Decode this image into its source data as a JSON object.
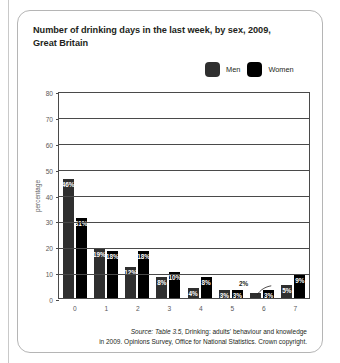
{
  "card": {
    "title": "Number of drinking days in the last week, by sex, 2009, Great Britain"
  },
  "legend": {
    "items": [
      {
        "label": "Men",
        "color": "#2f2f2f",
        "icon": "legend-swatch-icon"
      },
      {
        "label": "Women",
        "color": "#000000",
        "icon": "legend-swatch-icon"
      }
    ]
  },
  "source": {
    "italic_lead": "Source: Table 3.5,",
    "line1_rest": " Drinking: adults' behaviour and knowledge",
    "line2": "in 2009. Opinions Survey, Office for National Statistics. Crown copyright."
  },
  "chart_data": {
    "type": "bar",
    "title": "Number of drinking days in the last week, by sex, 2009, Great Britain",
    "xlabel": "",
    "ylabel": "percentage",
    "ylim": [
      0,
      80
    ],
    "yticks": [
      0,
      10,
      20,
      30,
      40,
      50,
      60,
      70,
      80
    ],
    "ytick_labels": [
      "0",
      "10",
      "20",
      "30",
      "40",
      "50",
      "60",
      "70",
      "80"
    ],
    "categories": [
      "0",
      "1",
      "2",
      "3",
      "4",
      "5",
      "6",
      "7"
    ],
    "grid": true,
    "legend_position": "top-right",
    "series": [
      {
        "name": "Men",
        "color": "#2f2f2f",
        "values": [
          46,
          19,
          12,
          8,
          4,
          3,
          2,
          5
        ],
        "labels": [
          "46%",
          "19%",
          "12%",
          "8%",
          "4%",
          "3%",
          "2%",
          "5%"
        ],
        "label_outside": [
          false,
          false,
          false,
          false,
          false,
          false,
          true,
          false
        ]
      },
      {
        "name": "Women",
        "color": "#000000",
        "values": [
          31,
          18,
          18,
          10,
          8,
          3,
          3,
          9
        ],
        "labels": [
          "31%",
          "18%",
          "18%",
          "10%",
          "8%",
          "3%",
          "3%",
          "9%"
        ],
        "label_outside": [
          false,
          false,
          false,
          false,
          false,
          false,
          false,
          false
        ]
      }
    ]
  }
}
